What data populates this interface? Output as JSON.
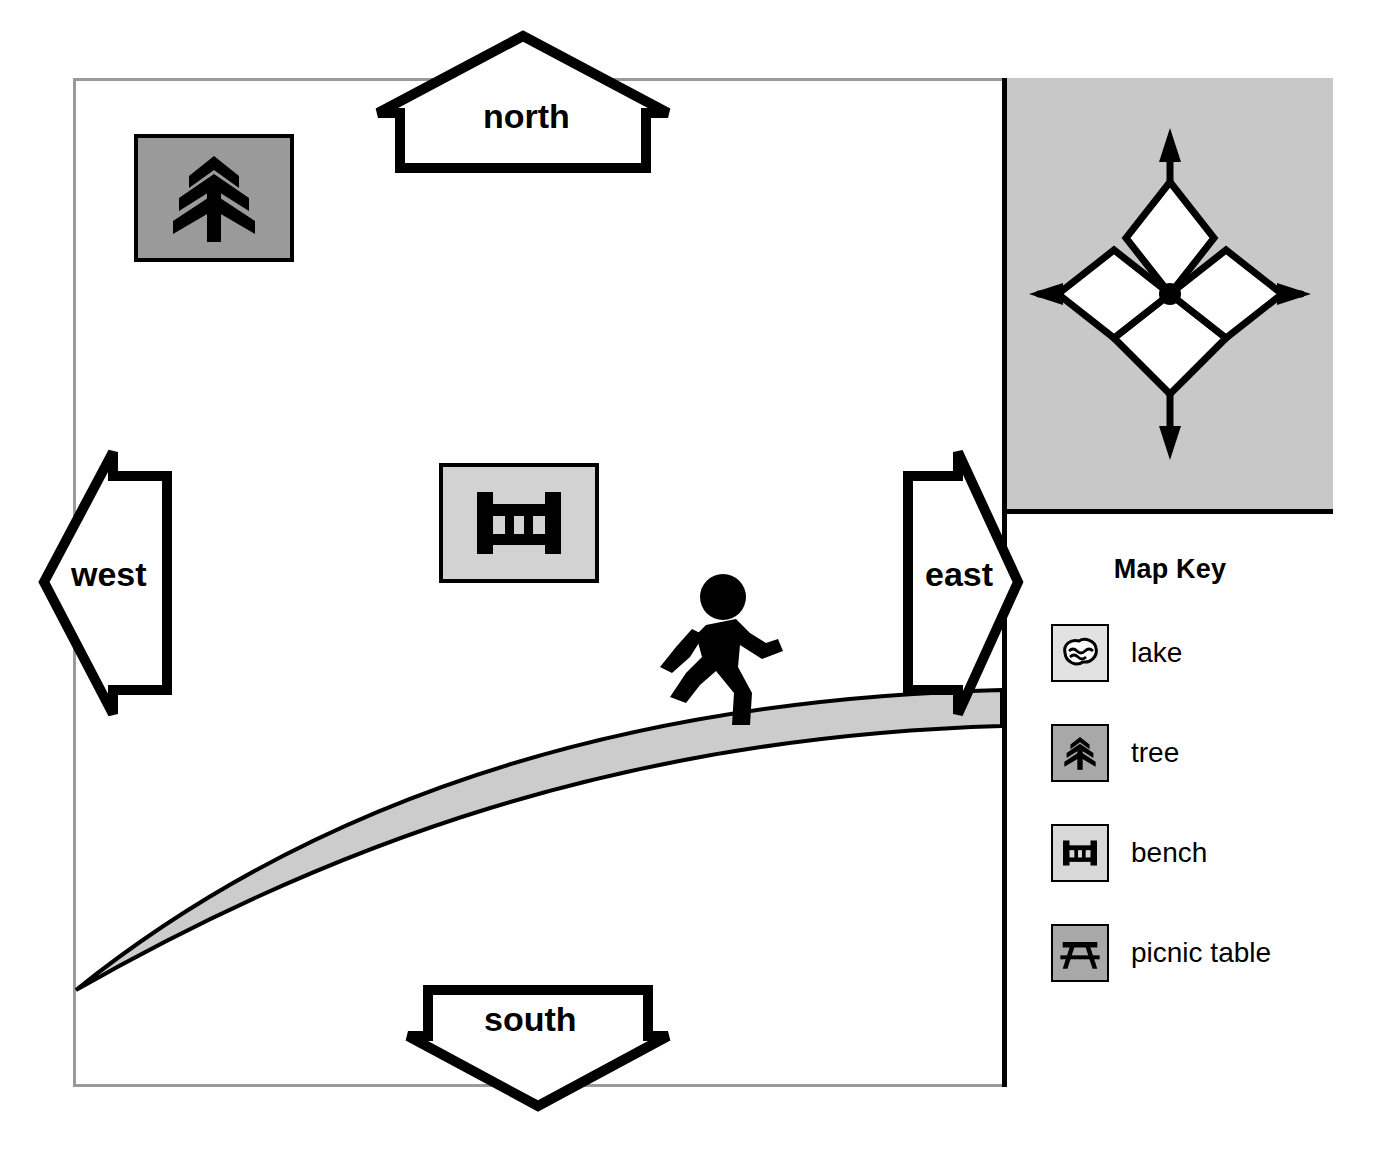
{
  "map": {
    "title": "park-map",
    "background_color": "#ffffff",
    "frame_color": "#9a9a9a",
    "divider_color": "#000000"
  },
  "compass": {
    "name": "compass-rose",
    "background_color": "#c8c8c8",
    "points": [
      "north",
      "east",
      "south",
      "west"
    ],
    "diamond_fill": "#ffffff",
    "center_dot_color": "#000000"
  },
  "direction_arrows": [
    {
      "id": "north",
      "label": "north",
      "direction": "up"
    },
    {
      "id": "south",
      "label": "south",
      "direction": "down"
    },
    {
      "id": "west",
      "label": "west",
      "direction": "left"
    },
    {
      "id": "east",
      "label": "east",
      "direction": "right"
    }
  ],
  "key": {
    "title": "Map Key",
    "items": [
      {
        "icon": "lake-icon",
        "label": "lake",
        "swatch_color": "#e2e2e2"
      },
      {
        "icon": "tree-icon",
        "label": "tree",
        "swatch_color": "#a8a8a8"
      },
      {
        "icon": "bench-icon",
        "label": "bench",
        "swatch_color": "#d8d8d8"
      },
      {
        "icon": "picnic-table-icon",
        "label": "picnic table",
        "swatch_color": "#a8a8a8"
      }
    ]
  },
  "features": [
    {
      "name": "tree-symbol",
      "icon": "tree-icon",
      "swatch_color": "#9a9a9a"
    },
    {
      "name": "bench-symbol",
      "icon": "bench-icon",
      "swatch_color": "#d2d2d2"
    },
    {
      "name": "path",
      "icon": "curved-path",
      "fill_color": "#cccccc"
    },
    {
      "name": "runner",
      "icon": "running-person-icon",
      "fill_color": "#000000"
    }
  ]
}
